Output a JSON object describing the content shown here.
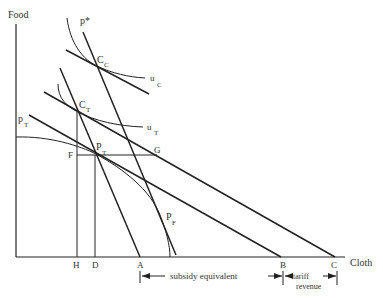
{
  "axes": {
    "y_label": "Food",
    "x_label": "Cloth"
  },
  "points": {
    "cc": {
      "main": "C",
      "sub": "C"
    },
    "ct": {
      "main": "C",
      "sub": "T"
    },
    "pt": {
      "main": "P",
      "sub": "T"
    },
    "pf": {
      "main": "P",
      "sub": "F"
    },
    "f": "F",
    "g": "G"
  },
  "curves": {
    "p_star": "p*",
    "p_t": {
      "main": "p",
      "sub": "T"
    },
    "u_c": {
      "main": "u",
      "sub": "C"
    },
    "u_t": {
      "main": "u",
      "sub": "T"
    }
  },
  "x_ticks": {
    "h": "H",
    "d": "D",
    "a": "A",
    "b": "B",
    "c": "C"
  },
  "annotations": {
    "subsidy": "subsidy equivalent",
    "tariff_line1": "tariff",
    "tariff_line2": "revenue"
  }
}
